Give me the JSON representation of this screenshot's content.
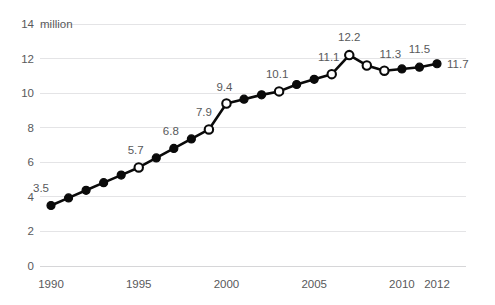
{
  "chart_data": {
    "type": "line",
    "title": "",
    "subtitle": "",
    "xlabel": "",
    "ylabel": "",
    "unit_label": "million",
    "grid": true,
    "legend": "none",
    "xlim": [
      1990,
      2012
    ],
    "ylim": [
      0,
      14
    ],
    "x_ticks": [
      "1990",
      "1995",
      "2000",
      "2005",
      "2010",
      "2012"
    ],
    "x_tick_values": [
      1990,
      1995,
      2000,
      2005,
      2010,
      2012
    ],
    "y_ticks": [
      "0",
      "2",
      "4",
      "6",
      "8",
      "10",
      "12",
      "14"
    ],
    "y_tick_values": [
      0,
      2,
      4,
      6,
      8,
      10,
      12,
      14
    ],
    "x": [
      1990,
      1991,
      1992,
      1993,
      1994,
      1995,
      1996,
      1997,
      1998,
      1999,
      2000,
      2001,
      2002,
      2003,
      2004,
      2005,
      2006,
      2007,
      2008,
      2009,
      2010,
      2011,
      2012
    ],
    "values": [
      3.5,
      3.94,
      4.38,
      4.82,
      5.26,
      5.7,
      6.25,
      6.8,
      7.35,
      7.9,
      9.4,
      9.65,
      9.9,
      10.1,
      10.5,
      10.8,
      11.1,
      12.2,
      11.6,
      11.3,
      11.4,
      11.5,
      11.7
    ],
    "marker_styles": [
      "filled",
      "filled",
      "filled",
      "filled",
      "filled",
      "open",
      "filled",
      "filled",
      "filled",
      "open",
      "open",
      "filled",
      "filled",
      "open",
      "filled",
      "filled",
      "open",
      "open",
      "open",
      "open",
      "filled",
      "filled",
      "filled"
    ],
    "point_labels": [
      {
        "x": 1990,
        "value": 3.5,
        "text": "3.5"
      },
      {
        "x": 1995,
        "value": 5.7,
        "text": "5.7"
      },
      {
        "x": 1997,
        "value": 6.8,
        "text": "6.8"
      },
      {
        "x": 1999,
        "value": 7.9,
        "text": "7.9"
      },
      {
        "x": 2000,
        "value": 9.4,
        "text": "9.4"
      },
      {
        "x": 2003,
        "value": 10.1,
        "text": "10.1"
      },
      {
        "x": 2006,
        "value": 11.1,
        "text": "11.1"
      },
      {
        "x": 2007,
        "value": 12.2,
        "text": "12.2"
      },
      {
        "x": 2009,
        "value": 11.3,
        "text": "11.3"
      },
      {
        "x": 2011,
        "value": 11.5,
        "text": "11.5"
      },
      {
        "x": 2012,
        "value": 11.7,
        "text": "11.7"
      }
    ],
    "colors": {
      "line": "#0a0a0a",
      "marker_fill": "#0a0a0a",
      "marker_open_fill": "#ffffff",
      "grid": "#e4e4e6",
      "text": "#58595b",
      "background": "#ffffff"
    }
  },
  "y_axis": {
    "labels": [
      "14",
      "12",
      "10",
      "8",
      "6",
      "4",
      "2",
      "0"
    ],
    "unit": "million"
  },
  "x_axis": {
    "labels": [
      "1990",
      "1995",
      "2000",
      "2005",
      "2010",
      "2012"
    ]
  },
  "data_labels": {
    "l0": "3.5",
    "l1": "5.7",
    "l2": "6.8",
    "l3": "7.9",
    "l4": "9.4",
    "l5": "10.1",
    "l6": "11.1",
    "l7": "12.2",
    "l8": "11.3",
    "l9": "11.5",
    "l10": "11.7"
  }
}
